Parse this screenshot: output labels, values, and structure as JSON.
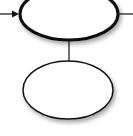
{
  "diagram": {
    "nodes": [
      {
        "id": "top-node",
        "label": "",
        "shape": "ellipse",
        "cx": 69,
        "cy": 14,
        "rx": 49,
        "ry": 26,
        "stroke": "#111111",
        "stroke_width": 3
      },
      {
        "id": "bottom-node",
        "label": "",
        "shape": "ellipse",
        "cx": 68,
        "cy": 90,
        "rx": 45,
        "ry": 29,
        "stroke": "#111111",
        "stroke_width": 1.5
      }
    ],
    "edges": [
      {
        "id": "incoming-arrow",
        "from": "left-edge",
        "to": "top-node",
        "arrow": true
      },
      {
        "id": "outgoing-line",
        "from": "top-node",
        "to": "right-edge",
        "arrow": false
      },
      {
        "id": "connector",
        "from": "top-node",
        "to": "bottom-node",
        "arrow": false
      }
    ],
    "colors": {
      "stroke": "#111111",
      "fill": "#ffffff",
      "shadow": "#bbbbbb"
    }
  }
}
